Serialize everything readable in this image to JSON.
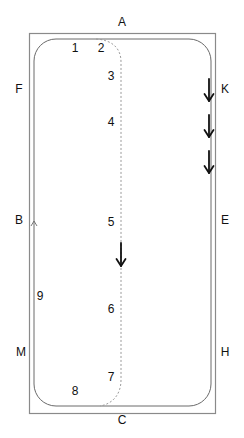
{
  "diagram": {
    "type": "dressage-arena-pattern",
    "colors": {
      "line": "#8a8a8a",
      "track": "#6a6a6a",
      "dashed": "#9a9a9a",
      "arrow": "#111111",
      "text": "#111111"
    },
    "letters": [
      {
        "id": "A",
        "label": "A",
        "x": 122,
        "y": 22
      },
      {
        "id": "K",
        "label": "K",
        "x": 225,
        "y": 89
      },
      {
        "id": "E",
        "label": "E",
        "x": 225,
        "y": 220
      },
      {
        "id": "H",
        "label": "H",
        "x": 225,
        "y": 352
      },
      {
        "id": "C",
        "label": "C",
        "x": 122,
        "y": 420
      },
      {
        "id": "M",
        "label": "M",
        "x": 21,
        "y": 352
      },
      {
        "id": "B",
        "label": "B",
        "x": 19,
        "y": 220
      },
      {
        "id": "F",
        "label": "F",
        "x": 19,
        "y": 89
      }
    ],
    "points": [
      {
        "id": "p1",
        "label": "1",
        "x": 75,
        "y": 48
      },
      {
        "id": "p2",
        "label": "2",
        "x": 101,
        "y": 48
      },
      {
        "id": "p3",
        "label": "3",
        "x": 111,
        "y": 76
      },
      {
        "id": "p4",
        "label": "4",
        "x": 111,
        "y": 122
      },
      {
        "id": "p5",
        "label": "5",
        "x": 111,
        "y": 222
      },
      {
        "id": "p6",
        "label": "6",
        "x": 111,
        "y": 309
      },
      {
        "id": "p7",
        "label": "7",
        "x": 111,
        "y": 377
      },
      {
        "id": "p8",
        "label": "8",
        "x": 75,
        "y": 391
      },
      {
        "id": "p9",
        "label": "9",
        "x": 40,
        "y": 296
      }
    ]
  }
}
